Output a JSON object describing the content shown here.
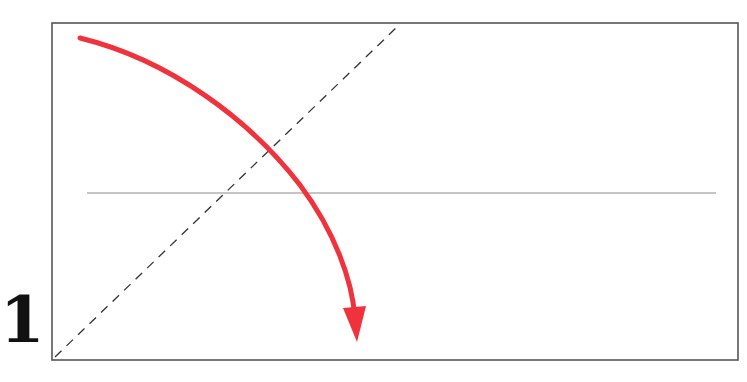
{
  "step": {
    "number": "1"
  },
  "diagram": {
    "frame": {
      "x": 52,
      "y": 23,
      "width": 686,
      "height": 337,
      "stroke": "#555555"
    },
    "crease_line": {
      "x1": 87,
      "y1": 193,
      "x2": 716,
      "y2": 193,
      "stroke": "#888888"
    },
    "fold_line_dashed": {
      "x1": 55,
      "y1": 357,
      "x2": 396,
      "y2": 28,
      "stroke": "#333333"
    },
    "arrow": {
      "color": "#f0323c",
      "path": "M80,38 C170,60 250,120 300,185 C335,232 352,280 355,318",
      "head_tip": [
        357,
        342
      ]
    }
  }
}
